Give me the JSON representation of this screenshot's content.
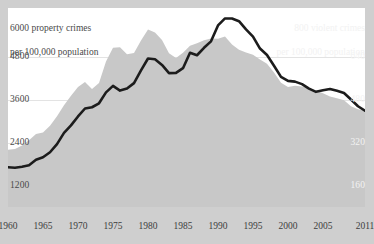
{
  "chart_data": {
    "type": "area",
    "title": "",
    "xlabel": "",
    "x": [
      1960,
      1961,
      1962,
      1963,
      1964,
      1965,
      1966,
      1967,
      1968,
      1969,
      1970,
      1971,
      1972,
      1973,
      1974,
      1975,
      1976,
      1977,
      1978,
      1979,
      1980,
      1981,
      1982,
      1983,
      1984,
      1985,
      1986,
      1987,
      1988,
      1989,
      1990,
      1991,
      1992,
      1993,
      1994,
      1995,
      1996,
      1997,
      1998,
      1999,
      2000,
      2001,
      2002,
      2003,
      2004,
      2005,
      2006,
      2007,
      2008,
      2009,
      2010,
      2011
    ],
    "x_tick_labels": [
      "1960",
      "1965",
      "1970",
      "1975",
      "1980",
      "1985",
      "1990",
      "1995",
      "2000",
      "2005",
      "2011"
    ],
    "x_tick_values": [
      1960,
      1965,
      1970,
      1975,
      1980,
      1985,
      1990,
      1995,
      2000,
      2005,
      2011
    ],
    "xlim": [
      1960,
      2011
    ],
    "grid": true,
    "legend_position": "none",
    "axes": [
      {
        "id": "left",
        "title": "6000 property crimes\nper 100,000 population",
        "title_value": "6000",
        "title_text": "property crimes\nper 100,000 population",
        "ticks": [
          1200,
          2400,
          3600,
          4800,
          6000
        ],
        "tick_labels": [
          "1200",
          "2400",
          "3600",
          "4800",
          "6000"
        ],
        "ylim": [
          0,
          6000
        ],
        "color": "#4a4a4a"
      },
      {
        "id": "right",
        "title": "800 violent crimes\nper 100,000 population",
        "title_value": "800",
        "title_text": "violent crimes\nper 100,000 population",
        "ticks": [
          160,
          320,
          480,
          640,
          800
        ],
        "tick_labels": [
          "160",
          "320",
          "480",
          "640",
          "800"
        ],
        "ylim": [
          0,
          800
        ],
        "color": "#f2f2f2"
      }
    ],
    "series": [
      {
        "name": "property crimes",
        "axis": "left",
        "render": "area",
        "fill_color": "#c8c8c8",
        "values": [
          1726,
          1747,
          1857,
          2012,
          2198,
          2249,
          2450,
          2736,
          3071,
          3351,
          3621,
          3769,
          3561,
          3737,
          4390,
          4800,
          4820,
          4602,
          4643,
          5017,
          5353,
          5264,
          5033,
          4637,
          4492,
          4651,
          4863,
          4940,
          5027,
          5078,
          5073,
          5140,
          4903,
          4740,
          4660,
          4591,
          4451,
          4316,
          4053,
          3744,
          3618,
          3658,
          3631,
          3591,
          3514,
          3432,
          3335,
          3276,
          3215,
          3041,
          2946,
          2909
        ]
      },
      {
        "name": "violent crimes",
        "axis": "right",
        "render": "line",
        "line_color": "#1c1c1c",
        "values": [
          160,
          158,
          162,
          168,
          190,
          200,
          220,
          253,
          298,
          328,
          364,
          396,
          401,
          417,
          461,
          487,
          468,
          476,
          498,
          549,
          597,
          594,
          571,
          538,
          539,
          558,
          620,
          610,
          640,
          666,
          730,
          758,
          758,
          747,
          714,
          685,
          637,
          611,
          568,
          523,
          507,
          504,
          494,
          476,
          463,
          469,
          474,
          467,
          458,
          432,
          405,
          387
        ]
      }
    ],
    "annotations": [
      {
        "text": "dark band marks years when the violent-crime line runs above the property-crime area"
      }
    ]
  },
  "left_axis": {
    "title_line1": "6000 property crimes",
    "title_line2": "per 100,000 population",
    "t4800": "4800",
    "t3600": "3600",
    "t2400": "2400",
    "t1200": "1200"
  },
  "right_axis": {
    "title_line1": "800 violent crimes",
    "title_line2": "per 100,000 population",
    "t640": "640",
    "t480": "480",
    "t320": "320",
    "t160": "160"
  },
  "x_axis": {
    "ticks": [
      "1960",
      "1965",
      "1970",
      "1975",
      "1980",
      "1985",
      "1990",
      "1995",
      "2000",
      "2005",
      "2011"
    ]
  },
  "colors": {
    "background": "#cfcfcf",
    "plot_background": "#ffffff",
    "area_fill": "#c8c8c8",
    "line": "#1c1c1c",
    "gridline": "#e3e3e3",
    "left_text": "#4a4a4a",
    "right_text": "#f2f2f2"
  }
}
